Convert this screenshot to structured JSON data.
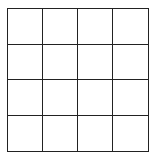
{
  "grid": {
    "rows": 4,
    "cols": 4,
    "line_color": "#222222",
    "cell_color": "#ffffff"
  }
}
